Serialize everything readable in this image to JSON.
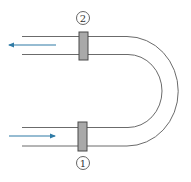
{
  "diagram": {
    "type": "U-bend pipe with flow direction",
    "stations": [
      {
        "id": "1",
        "label": "1",
        "position": "inlet (bottom)"
      },
      {
        "id": "2",
        "label": "2",
        "position": "outlet (top)"
      }
    ],
    "flow": {
      "inlet_direction": "right",
      "outlet_direction": "left"
    },
    "colors": {
      "pipe_line": "#6b6b6b",
      "flange_fill": "#a9a9a9",
      "flange_border": "#4a4a4a",
      "arrow": "#2f7ba6",
      "circle_stroke": "#555555"
    }
  }
}
